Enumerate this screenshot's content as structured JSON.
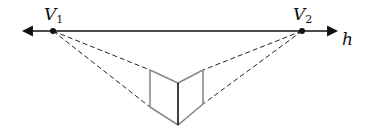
{
  "diagram": {
    "horizon_label": "h",
    "vanishing_points": [
      {
        "name": "V",
        "subscript": "1"
      },
      {
        "name": "V",
        "subscript": "2"
      }
    ],
    "colors": {
      "line": "#111111",
      "dashed": "#222222",
      "box": "#8a8a8a",
      "front_edge": "#111111"
    }
  }
}
